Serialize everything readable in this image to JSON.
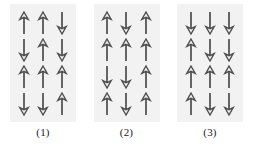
{
  "figure": {
    "title": "",
    "arrow_color": "#4d4d4d",
    "panel_background": "#f2f2f2",
    "page_background": "#ffffff",
    "label_color": "#1a1a1a",
    "grid": {
      "rows": 4,
      "columns": 3
    },
    "panels": [
      {
        "label": "(1)",
        "rows": [
          [
            "up",
            "up",
            "down"
          ],
          [
            "down",
            "up",
            "down"
          ],
          [
            "up",
            "up",
            "up"
          ],
          [
            "down",
            "down",
            "up"
          ]
        ]
      },
      {
        "label": "(2)",
        "rows": [
          [
            "up",
            "down",
            "up"
          ],
          [
            "up",
            "up",
            "up"
          ],
          [
            "down",
            "down",
            "up"
          ],
          [
            "up",
            "down",
            "up"
          ]
        ]
      },
      {
        "label": "(3)",
        "rows": [
          [
            "down",
            "down",
            "down"
          ],
          [
            "up",
            "down",
            "down"
          ],
          [
            "up",
            "up",
            "up"
          ],
          [
            "up",
            "down",
            "down"
          ]
        ]
      }
    ]
  }
}
